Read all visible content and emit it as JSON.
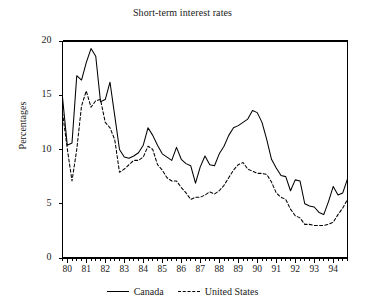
{
  "chart_data": {
    "type": "line",
    "title": "Short-term interest rates",
    "xlabel": "",
    "ylabel": "Percentages",
    "xlim": [
      1979.75,
      1994.75
    ],
    "ylim": [
      0,
      20
    ],
    "yticks": [
      0,
      5,
      10,
      15,
      20
    ],
    "ytick_labels": [
      "0",
      "5",
      "10",
      "15",
      "20"
    ],
    "xticks": [
      80,
      81,
      82,
      83,
      84,
      85,
      86,
      87,
      88,
      89,
      90,
      91,
      92,
      93,
      94
    ],
    "xtick_labels": [
      "80",
      "81",
      "82",
      "83",
      "84",
      "85",
      "86",
      "87",
      "88",
      "89",
      "90",
      "91",
      "92",
      "93",
      "94"
    ],
    "minor_tick_interval": 0.25,
    "grid": false,
    "legend_position": "bottom-center",
    "x": [
      1979.75,
      1980.0,
      1980.25,
      1980.5,
      1980.75,
      1981.0,
      1981.25,
      1981.5,
      1981.75,
      1982.0,
      1982.25,
      1982.5,
      1982.75,
      1983.0,
      1983.25,
      1983.5,
      1983.75,
      1984.0,
      1984.25,
      1984.5,
      1984.75,
      1985.0,
      1985.25,
      1985.5,
      1985.75,
      1986.0,
      1986.25,
      1986.5,
      1986.75,
      1987.0,
      1987.25,
      1987.5,
      1987.75,
      1988.0,
      1988.25,
      1988.5,
      1988.75,
      1989.0,
      1989.25,
      1989.5,
      1989.75,
      1990.0,
      1990.25,
      1990.5,
      1990.75,
      1991.0,
      1991.25,
      1991.5,
      1991.75,
      1992.0,
      1992.25,
      1992.5,
      1992.75,
      1993.0,
      1993.25,
      1993.5,
      1993.75,
      1994.0,
      1994.25,
      1994.5,
      1994.75
    ],
    "series": [
      {
        "name": "Canada",
        "style": "solid",
        "color": "#000000",
        "values": [
          14.8,
          10.4,
          10.6,
          16.8,
          16.4,
          18.0,
          19.3,
          18.6,
          14.4,
          14.6,
          16.2,
          13.1,
          10.0,
          9.3,
          9.2,
          9.4,
          9.7,
          10.4,
          12.0,
          11.3,
          10.4,
          9.6,
          9.3,
          9.0,
          10.2,
          9.1,
          8.7,
          8.5,
          6.9,
          8.4,
          9.4,
          8.6,
          8.5,
          9.6,
          10.3,
          11.3,
          12.0,
          12.2,
          12.5,
          12.8,
          13.6,
          13.4,
          12.5,
          10.9,
          9.1,
          8.3,
          7.6,
          7.5,
          6.2,
          7.2,
          7.1,
          5.0,
          4.8,
          4.7,
          4.2,
          4.0,
          5.2,
          6.6,
          5.8,
          6.0,
          7.3
        ]
      },
      {
        "name": "United States",
        "style": "dashed",
        "color": "#000000",
        "values": [
          13.4,
          10.1,
          7.1,
          10.0,
          14.0,
          15.4,
          13.9,
          14.5,
          14.6,
          12.5,
          12.0,
          10.9,
          7.9,
          8.2,
          8.6,
          9.0,
          9.0,
          9.3,
          10.3,
          10.0,
          8.6,
          8.1,
          7.4,
          7.1,
          7.1,
          6.5,
          6.0,
          5.4,
          5.6,
          5.6,
          5.8,
          6.1,
          5.9,
          6.2,
          6.7,
          7.4,
          8.1,
          8.6,
          8.8,
          8.2,
          8.0,
          7.8,
          7.8,
          7.7,
          7.0,
          6.0,
          5.6,
          5.4,
          4.5,
          3.9,
          3.7,
          3.1,
          3.1,
          3.0,
          3.0,
          3.0,
          3.1,
          3.3,
          4.0,
          4.6,
          5.4
        ]
      }
    ]
  }
}
